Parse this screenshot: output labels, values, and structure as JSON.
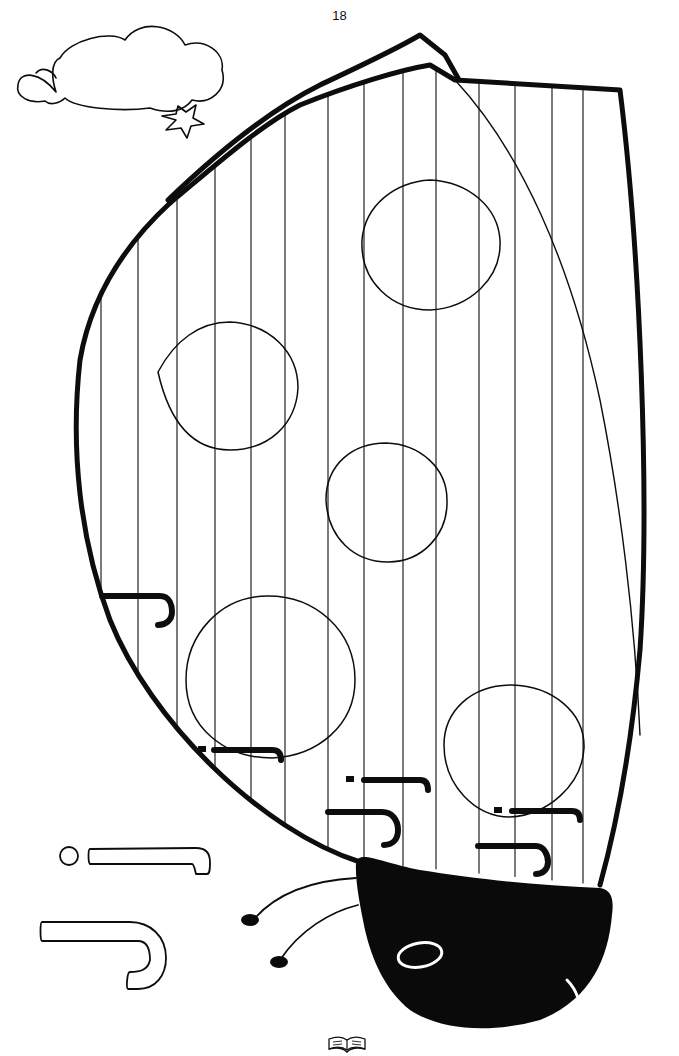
{
  "page": {
    "number": "18",
    "ink_color": "#0d0d0d",
    "paper_color": "#ffffff"
  },
  "illustration": {
    "subject": "ladybug",
    "shell_spots": 5,
    "stripe_count": 14,
    "decorations": [
      "cloud-icon",
      "star-icon"
    ]
  },
  "letters": {
    "traced_on_shell": [
      "ר",
      "י ר",
      "י ר",
      "י ר",
      "ר",
      "ר"
    ],
    "outlined_examples": [
      "י ר",
      "ר"
    ]
  },
  "footer": {
    "icon": "open-book-icon"
  }
}
